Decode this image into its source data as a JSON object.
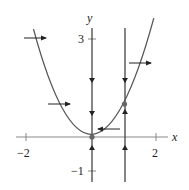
{
  "diagram": {
    "type": "phase-plane",
    "axes": {
      "x_label": "x",
      "y_label": "y",
      "x_ticks": [
        {
          "value": -2,
          "label": "−2"
        },
        {
          "value": 2,
          "label": "2"
        }
      ],
      "y_ticks": [
        {
          "value": 3,
          "label": "3"
        },
        {
          "value": -1,
          "label": "−1"
        }
      ]
    },
    "curves": [
      {
        "name": "parabola",
        "equation": "y = x^2"
      },
      {
        "name": "vertical-line-x0",
        "equation": "x = 0"
      },
      {
        "name": "vertical-line-x1",
        "equation": "x = 1"
      }
    ],
    "equilibrium_points": [
      {
        "x": 0,
        "y": 0
      },
      {
        "x": 1,
        "y": 1
      }
    ],
    "colors": {
      "curve": "#555555",
      "axis": "#777777",
      "arrow": "#222222"
    }
  }
}
